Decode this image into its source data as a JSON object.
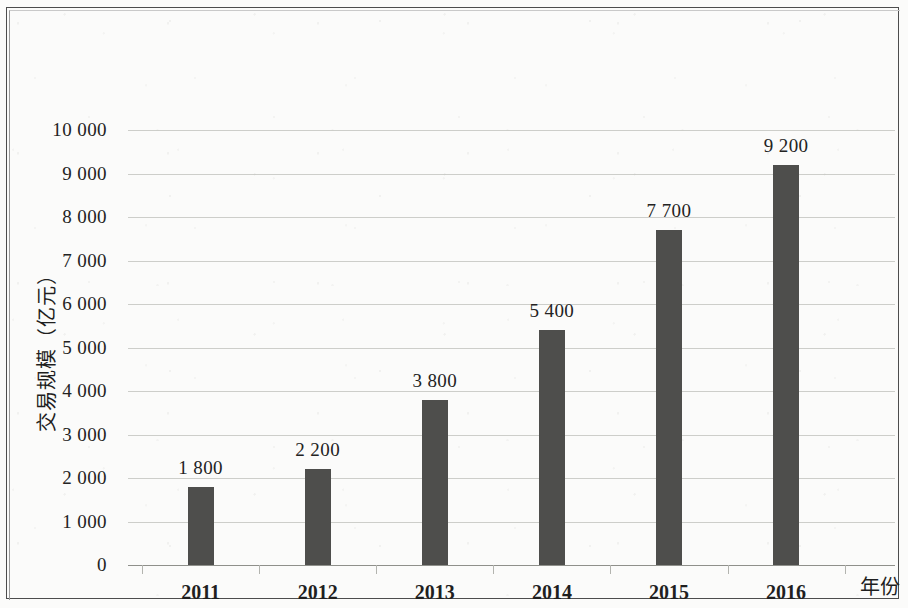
{
  "chart_data": {
    "type": "bar",
    "title": "",
    "xlabel": "年份",
    "ylabel": "交易规模（亿元）",
    "categories": [
      "2011",
      "2012",
      "2013",
      "2014",
      "2015",
      "2016"
    ],
    "values": [
      1800,
      2200,
      3800,
      5400,
      7700,
      9200
    ],
    "value_labels": [
      "1 800",
      "2 200",
      "3 800",
      "5 400",
      "7 700",
      "9 200"
    ],
    "ylim": [
      0,
      10000
    ],
    "ytick_values": [
      0,
      1000,
      2000,
      3000,
      4000,
      5000,
      6000,
      7000,
      8000,
      9000,
      10000
    ],
    "ytick_labels": [
      "0",
      "1 000",
      "2 000",
      "3 000",
      "4 000",
      "5 000",
      "6 000",
      "7 000",
      "8 000",
      "9 000",
      "10 000"
    ],
    "grid": true,
    "legend": "none",
    "bar_color": "#4e4e4c",
    "gridline_color": "#c4c6c1",
    "axis_color": "#8f908b",
    "background_color": "#fbfbfa",
    "frame_color": "#4d4d4d"
  }
}
